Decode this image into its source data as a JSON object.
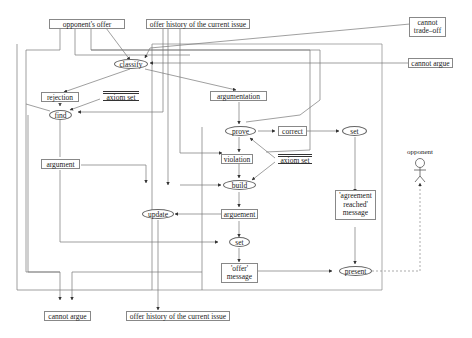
{
  "diagram": {
    "type": "data-flow / process diagram",
    "inputs": {
      "opponents_offer": "opponent's offer",
      "offer_history_top": "offer history of the current issue",
      "cannot_tradeoff": [
        "cannot",
        "trade–off"
      ],
      "cannot_argue_right": "cannot argue"
    },
    "processes": {
      "classify": "classify",
      "find": "find",
      "prove": "prove",
      "build": "build",
      "update": "update",
      "set_right": "set",
      "set_bottom": "set",
      "present": "present"
    },
    "data": {
      "rejection": "rejection",
      "axiom_set_left": "axiom set",
      "argumentation": "argumentation",
      "argument": "argument",
      "correct": "correct",
      "violation": "violation",
      "axiom_set_right": "axiom set",
      "arguement": "arguement",
      "agreement_msg": [
        "'agreement",
        "reached'",
        "message"
      ],
      "offer_msg": [
        "'offer'",
        "message"
      ]
    },
    "outputs": {
      "cannot_argue_bottom": "cannot argue",
      "offer_history_bottom": "offer history of the current issue"
    },
    "actor": {
      "label": "opponent"
    }
  }
}
